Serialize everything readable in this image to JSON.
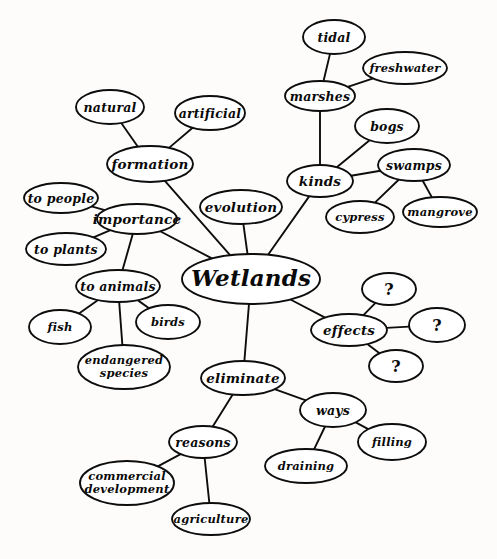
{
  "diagram": {
    "title": "Wetlands",
    "type": "concept-map",
    "style": {
      "ink": "#0d0d0d",
      "paper": "#fdfcfb",
      "node_fill": "#ffffff"
    },
    "nodes": [
      {
        "id": "wetlands",
        "label": "Wetlands",
        "cx": 251,
        "cy": 279,
        "rx": 69,
        "ry": 25,
        "level": "center"
      },
      {
        "id": "kinds",
        "label": "kinds",
        "cx": 320,
        "cy": 181,
        "rx": 33,
        "ry": 16,
        "level": "lvl1"
      },
      {
        "id": "marshes",
        "label": "marshes",
        "cx": 320,
        "cy": 96,
        "rx": 35,
        "ry": 15,
        "level": "lvl2"
      },
      {
        "id": "tidal",
        "label": "tidal",
        "cx": 334,
        "cy": 37,
        "rx": 31,
        "ry": 17,
        "level": "lvl2"
      },
      {
        "id": "freshwater",
        "label": "freshwater",
        "cx": 405,
        "cy": 68,
        "rx": 42,
        "ry": 16,
        "level": "lvl3"
      },
      {
        "id": "bogs",
        "label": "bogs",
        "cx": 387,
        "cy": 126,
        "rx": 32,
        "ry": 17,
        "level": "lvl2"
      },
      {
        "id": "swamps",
        "label": "swamps",
        "cx": 414,
        "cy": 165,
        "rx": 36,
        "ry": 16,
        "level": "lvl2"
      },
      {
        "id": "cypress",
        "label": "cypress",
        "cx": 360,
        "cy": 217,
        "rx": 34,
        "ry": 16,
        "level": "lvl3"
      },
      {
        "id": "mangrove",
        "label": "mangrove",
        "cx": 440,
        "cy": 212,
        "rx": 37,
        "ry": 15,
        "level": "lvl3"
      },
      {
        "id": "evolution",
        "label": "evolution",
        "cx": 241,
        "cy": 207,
        "rx": 41,
        "ry": 17,
        "level": "lvl1"
      },
      {
        "id": "formation",
        "label": "formation",
        "cx": 150,
        "cy": 164,
        "rx": 43,
        "ry": 18,
        "level": "lvl1"
      },
      {
        "id": "natural",
        "label": "natural",
        "cx": 110,
        "cy": 107,
        "rx": 34,
        "ry": 17,
        "level": "lvl2"
      },
      {
        "id": "artificial",
        "label": "artificial",
        "cx": 210,
        "cy": 113,
        "rx": 35,
        "ry": 17,
        "level": "lvl2"
      },
      {
        "id": "importance",
        "label": "importance",
        "cx": 137,
        "cy": 219,
        "rx": 40,
        "ry": 15,
        "level": "lvl1"
      },
      {
        "id": "to-people",
        "label": "to people",
        "cx": 61,
        "cy": 198,
        "rx": 37,
        "ry": 15,
        "level": "lvl2"
      },
      {
        "id": "to-plants",
        "label": "to plants",
        "cx": 66,
        "cy": 249,
        "rx": 40,
        "ry": 16,
        "level": "lvl2"
      },
      {
        "id": "to-animals",
        "label": "to animals",
        "cx": 118,
        "cy": 286,
        "rx": 42,
        "ry": 16,
        "level": "lvl2"
      },
      {
        "id": "fish",
        "label": "fish",
        "cx": 60,
        "cy": 327,
        "rx": 31,
        "ry": 17,
        "level": "lvl3"
      },
      {
        "id": "birds",
        "label": "birds",
        "cx": 168,
        "cy": 322,
        "rx": 32,
        "ry": 17,
        "level": "lvl3"
      },
      {
        "id": "endangered",
        "label": "endangered species",
        "cx": 124,
        "cy": 367,
        "rx": 46,
        "ry": 22,
        "level": "lvl3",
        "lines": [
          "endangered",
          "species"
        ]
      },
      {
        "id": "effects",
        "label": "effects",
        "cx": 349,
        "cy": 330,
        "rx": 38,
        "ry": 16,
        "level": "lvl1"
      },
      {
        "id": "q1",
        "label": "?",
        "cx": 389,
        "cy": 289,
        "rx": 27,
        "ry": 16,
        "level": "qmark"
      },
      {
        "id": "q2",
        "label": "?",
        "cx": 437,
        "cy": 325,
        "rx": 28,
        "ry": 17,
        "level": "qmark"
      },
      {
        "id": "q3",
        "label": "?",
        "cx": 396,
        "cy": 366,
        "rx": 27,
        "ry": 16,
        "level": "qmark"
      },
      {
        "id": "eliminate",
        "label": "eliminate",
        "cx": 243,
        "cy": 378,
        "rx": 42,
        "ry": 17,
        "level": "lvl1"
      },
      {
        "id": "reasons",
        "label": "reasons",
        "cx": 203,
        "cy": 442,
        "rx": 34,
        "ry": 16,
        "level": "lvl2"
      },
      {
        "id": "commercial",
        "label": "commercial development",
        "cx": 127,
        "cy": 483,
        "rx": 47,
        "ry": 22,
        "level": "lvl3",
        "lines": [
          "commercial",
          "development"
        ]
      },
      {
        "id": "agriculture",
        "label": "agriculture",
        "cx": 211,
        "cy": 519,
        "rx": 39,
        "ry": 16,
        "level": "lvl3"
      },
      {
        "id": "ways",
        "label": "ways",
        "cx": 333,
        "cy": 410,
        "rx": 33,
        "ry": 17,
        "level": "lvl2"
      },
      {
        "id": "draining",
        "label": "draining",
        "cx": 306,
        "cy": 466,
        "rx": 41,
        "ry": 17,
        "level": "lvl3"
      },
      {
        "id": "filling",
        "label": "filling",
        "cx": 392,
        "cy": 442,
        "rx": 34,
        "ry": 18,
        "level": "lvl3"
      }
    ],
    "edges": [
      {
        "from": "wetlands",
        "to": "kinds"
      },
      {
        "from": "kinds",
        "to": "marshes"
      },
      {
        "from": "marshes",
        "to": "tidal"
      },
      {
        "from": "marshes",
        "to": "freshwater"
      },
      {
        "from": "kinds",
        "to": "bogs"
      },
      {
        "from": "kinds",
        "to": "swamps"
      },
      {
        "from": "swamps",
        "to": "cypress"
      },
      {
        "from": "swamps",
        "to": "mangrove"
      },
      {
        "from": "wetlands",
        "to": "evolution"
      },
      {
        "from": "wetlands",
        "to": "formation"
      },
      {
        "from": "formation",
        "to": "natural"
      },
      {
        "from": "formation",
        "to": "artificial"
      },
      {
        "from": "wetlands",
        "to": "importance"
      },
      {
        "from": "importance",
        "to": "to-people"
      },
      {
        "from": "importance",
        "to": "to-plants"
      },
      {
        "from": "importance",
        "to": "to-animals"
      },
      {
        "from": "to-animals",
        "to": "fish"
      },
      {
        "from": "to-animals",
        "to": "birds"
      },
      {
        "from": "to-animals",
        "to": "endangered"
      },
      {
        "from": "wetlands",
        "to": "effects"
      },
      {
        "from": "effects",
        "to": "q1"
      },
      {
        "from": "effects",
        "to": "q2"
      },
      {
        "from": "effects",
        "to": "q3"
      },
      {
        "from": "wetlands",
        "to": "eliminate"
      },
      {
        "from": "eliminate",
        "to": "reasons"
      },
      {
        "from": "reasons",
        "to": "commercial"
      },
      {
        "from": "reasons",
        "to": "agriculture"
      },
      {
        "from": "eliminate",
        "to": "ways"
      },
      {
        "from": "ways",
        "to": "draining"
      },
      {
        "from": "ways",
        "to": "filling"
      }
    ]
  }
}
